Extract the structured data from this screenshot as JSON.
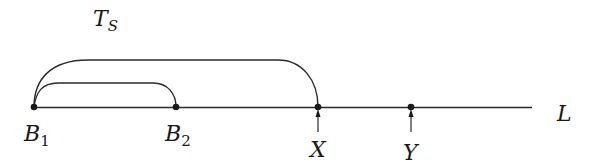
{
  "diagram": {
    "type": "number-line-intervals",
    "line_label": "L",
    "span_label": {
      "main": "T",
      "sub": "S"
    },
    "points": [
      {
        "id": "B1",
        "main": "B",
        "sub": "1"
      },
      {
        "id": "B2",
        "main": "B",
        "sub": "2"
      },
      {
        "id": "X",
        "main": "X",
        "sub": ""
      },
      {
        "id": "Y",
        "main": "Y",
        "sub": ""
      }
    ],
    "arcs": [
      {
        "from": "B1",
        "to": "B2",
        "label": ""
      },
      {
        "from": "B1",
        "to": "X",
        "label": "T_S"
      }
    ],
    "arrows_to": [
      "X",
      "Y"
    ],
    "colors": {
      "stroke": "#2a2a2a",
      "text": "#1a1a1a",
      "background": "#ffffff"
    }
  }
}
